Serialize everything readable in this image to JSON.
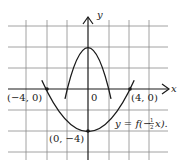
{
  "figure": {
    "axes": {
      "x_label": "x",
      "y_label": "y",
      "origin_label": "0"
    },
    "points": [
      {
        "label": "(−4, 0)",
        "x": -4,
        "y": 0
      },
      {
        "label": "(4, 0)",
        "x": 4,
        "y": 0
      },
      {
        "label": "(0, −4)",
        "x": 0,
        "y": -4
      }
    ],
    "curves": [
      {
        "name": "f",
        "equation": "y = f(x)",
        "vertex": [
          0,
          4
        ],
        "roots": [
          -2,
          2
        ],
        "label": ""
      },
      {
        "name": "transformed",
        "equation": "y = f(−½x).",
        "vertex": [
          0,
          -4
        ],
        "roots": [
          -4,
          4
        ],
        "label": "y = f(−½x)."
      }
    ],
    "grid": {
      "units_per_cell": 2,
      "x_range": [
        -8,
        8
      ],
      "y_range": [
        -6,
        6
      ]
    }
  },
  "labels": {
    "x_axis": "x",
    "y_axis": "y",
    "origin": "0",
    "point_left": "(−4, 0)",
    "point_right": "(4, 0)",
    "point_bottom": "(0, −4)",
    "curve_label_prefix": "y = f(−",
    "curve_label_frac_num": "1",
    "curve_label_frac_den": "2",
    "curve_label_suffix": "x)."
  }
}
